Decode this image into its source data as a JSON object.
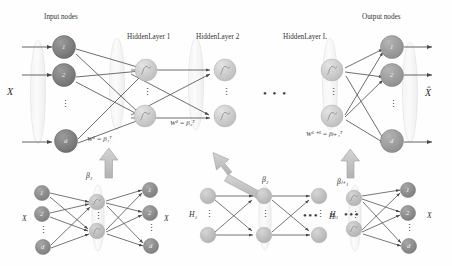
{
  "figure": {
    "headers": {
      "input_nodes": "Input nodes",
      "hidden_layer_1": "HiddenLayer 1",
      "hidden_layer_2": "HiddenLayer 2",
      "hidden_layer_L": "HiddenLayer L",
      "output_nodes": "Output nodes"
    },
    "io_labels": {
      "input": "X",
      "output": "X̂"
    },
    "weights": [
      {
        "name": "weight-1",
        "text": "W¹ = β₁ᵀ"
      },
      {
        "name": "weight-2",
        "text": "W² = β₂ᵀ"
      },
      {
        "name": "weight-L1",
        "text": "Wᴸ⁺¹ = βₗ₊₁ᵀ"
      }
    ],
    "node_labels": {
      "first": "1",
      "second": "2",
      "last": "d",
      "vdots": "⋮"
    },
    "ellipsis_h": "• • •",
    "ellipsis_h_small": "•••",
    "main_layers": [
      {
        "name": "input-layer",
        "kind": "numbered",
        "labels": [
          "1",
          "2",
          "d"
        ]
      },
      {
        "name": "hidden-layer-1",
        "kind": "sigmoid",
        "labels": [
          "",
          ""
        ]
      },
      {
        "name": "hidden-layer-2",
        "kind": "sigmoid",
        "labels": [
          "",
          ""
        ]
      },
      {
        "name": "hidden-layer-L",
        "kind": "sigmoid",
        "labels": [
          "",
          ""
        ]
      },
      {
        "name": "output-layer",
        "kind": "numbered",
        "labels": [
          "1",
          "2",
          "d"
        ]
      }
    ],
    "autoencoders": [
      {
        "name": "autoencoder-1",
        "beta": "β₁",
        "input_label": "X",
        "output_label": "X",
        "in_nodes": [
          "1",
          "2",
          "d"
        ],
        "out_nodes": [
          "1",
          "2",
          "d"
        ]
      },
      {
        "name": "autoencoder-2",
        "beta": "β₂",
        "input_label": "H₁",
        "output_label": "H₁",
        "in_nodes": [
          "",
          ""
        ],
        "out_nodes": [
          "",
          ""
        ]
      },
      {
        "name": "autoencoder-L1",
        "beta": "βₗ₊₁",
        "input_label": "Hₗ",
        "output_label": "X",
        "in_nodes": [
          "",
          ""
        ],
        "out_nodes": [
          "1",
          "2",
          "d"
        ]
      }
    ],
    "colors": {
      "input_node": "#7d7d7d",
      "hidden_node": "#c9c9c9",
      "output_node": "#9a9a9a",
      "ae_dark_node": "#8a8a8a",
      "ae_light_node": "#bdbdbd",
      "edge": "#4a4a4a",
      "capsule_stroke": "#d8d8d8",
      "block_arrow": "#c2c2c2",
      "block_arrow_stroke": "#a8a8a8",
      "text": "#2b2b2b"
    }
  }
}
